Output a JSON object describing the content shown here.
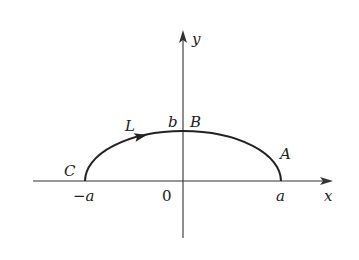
{
  "diagram": {
    "type": "coordinate-curve",
    "axes": {
      "x_label": "x",
      "y_label": "y",
      "origin_label": "0"
    },
    "ticks": {
      "neg_a": "−a",
      "pos_a": "a",
      "b": "b"
    },
    "points": {
      "A": "A",
      "B": "B",
      "C": "C"
    },
    "curve": {
      "label": "L",
      "direction": "from C toward B (arrow pointing right along upper arc)"
    },
    "colors": {
      "stroke": "#222222",
      "axis": "#333333",
      "background": "#ffffff"
    }
  }
}
